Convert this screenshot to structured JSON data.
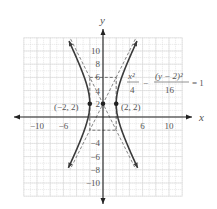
{
  "chart_data": {
    "type": "line",
    "title": "",
    "xlabel": "x",
    "ylabel": "y",
    "xlim": [
      -12,
      12
    ],
    "ylim": [
      -12,
      12
    ],
    "grid": true,
    "grid_spacing": 1,
    "x_tick_labels": [
      "-10",
      "-6",
      "6",
      "10"
    ],
    "x_tick_values": [
      -10,
      -6,
      6,
      10
    ],
    "y_tick_labels": [
      "10",
      "8",
      "6",
      "4",
      "2",
      "-4",
      "-6",
      "-8",
      "-10"
    ],
    "y_tick_values": [
      10,
      8,
      6,
      4,
      2,
      -4,
      -6,
      -8,
      -10
    ],
    "equation": {
      "term1_num": "x²",
      "term1_den": "4",
      "minus": "−",
      "term2_num": "(y − 2)²",
      "term2_den": "16",
      "rhs": "= 1"
    },
    "hyperbola": {
      "center": [
        0,
        2
      ],
      "a": 2,
      "b": 4,
      "orientation": "horizontal",
      "y_range": [
        -7.7,
        11.5
      ]
    },
    "asymptotes": [
      {
        "slope": 2,
        "intercept": 2,
        "style": "dashed"
      },
      {
        "slope": -2,
        "intercept": 2,
        "style": "dashed"
      }
    ],
    "fundamental_rectangle": {
      "x": [
        -2,
        2
      ],
      "y": [
        -2,
        6
      ],
      "style": "dashed"
    },
    "points": [
      {
        "x": -2,
        "y": 2,
        "label": "(−2, 2)"
      },
      {
        "x": 0,
        "y": 2,
        "label": ""
      },
      {
        "x": 2,
        "y": 2,
        "label": "(2, 2)"
      }
    ],
    "colors": {
      "curve": "#3a3a3a",
      "grid": "#cfcfcf",
      "axis": "#222222",
      "text": "#555555"
    }
  }
}
